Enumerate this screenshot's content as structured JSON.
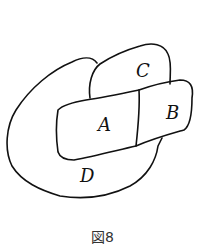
{
  "diagram": {
    "regions": [
      {
        "id": "A",
        "label": "A"
      },
      {
        "id": "B",
        "label": "B"
      },
      {
        "id": "C",
        "label": "C"
      },
      {
        "id": "D",
        "label": "D"
      }
    ],
    "stroke_color": "#111111"
  },
  "caption": "図8"
}
